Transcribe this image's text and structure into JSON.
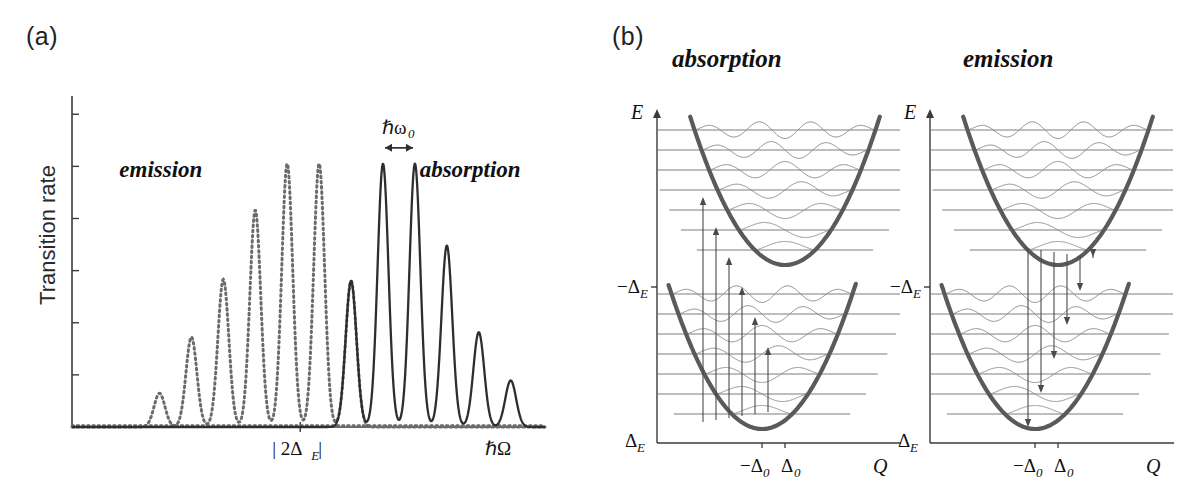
{
  "figure": {
    "panel_a_label": "(a)",
    "panel_b_label": "(b)"
  },
  "panel_a": {
    "y_axis_label": "Transition rate",
    "x_axis_label": "ℏΩ",
    "x_tick_label_main": "| 2Δ",
    "x_tick_label_sub": "E",
    "x_tick_label_end": " |",
    "annotation_spacing": "ℏω",
    "annotation_spacing_sub": "0",
    "region_left_label": "emission",
    "region_right_label": "absorption",
    "n_yticks": 6
  },
  "panel_b": {
    "left": {
      "title": "absorption",
      "y_axis_label": "E",
      "x_axis_label": "Q",
      "y_tick_upper": "−Δ",
      "y_tick_upper_sub": "E",
      "y_tick_lower": "Δ",
      "y_tick_lower_sub": "E",
      "x_tick_left": "−Δ",
      "x_tick_left_sub": "0",
      "x_tick_right": "Δ",
      "x_tick_right_sub": "0",
      "arrow_direction": "up",
      "n_transition_arrows": 6,
      "n_levels_per_well": 9
    },
    "right": {
      "title": "emission",
      "y_axis_label": "E",
      "x_axis_label": "Q",
      "y_tick_upper": "−Δ",
      "y_tick_upper_sub": "E",
      "y_tick_lower": "Δ",
      "y_tick_lower_sub": "E",
      "x_tick_left": "−Δ",
      "x_tick_left_sub": "0",
      "x_tick_right": "Δ",
      "x_tick_right_sub": "0",
      "arrow_direction": "down",
      "n_transition_arrows": 6,
      "n_levels_per_well": 9
    }
  },
  "colors": {
    "curve_solid": "#2e2e2e",
    "curve_dotted": "#6b6b6b",
    "axis": "#3a3a3a",
    "parabola": "#5a5a5a",
    "wavefunction": "#8a8a8a",
    "level_line": "#7d7d7d",
    "arrow": "#4a4a4a",
    "text": "#111111",
    "background": "#ffffff"
  },
  "chart_data": {
    "type": "line",
    "xlabel": "ℏΩ",
    "ylabel": "Transition rate",
    "xlim": [
      0,
      1
    ],
    "ylim": [
      0,
      1
    ],
    "grid": false,
    "legend": null,
    "annotations": [
      {
        "text": "emission",
        "x": 0.18,
        "y": 0.77
      },
      {
        "text": "absorption",
        "x": 0.8,
        "y": 0.77
      },
      {
        "text": "ℏω₀",
        "x": 0.585,
        "y": 0.9,
        "note": "double-headed arrow marks one-phonon peak spacing"
      },
      {
        "text": "| 2ΔE |",
        "x": 0.47,
        "y": -0.08,
        "note": "x-axis tick marking the zero-phonon gap"
      }
    ],
    "series": [
      {
        "name": "emission",
        "style": "dotted",
        "color": "#6b6b6b",
        "peak_spacing": 0.0675,
        "peak_width_sigma": 0.0115,
        "peaks_x": [
          0.185,
          0.2525,
          0.32,
          0.3875,
          0.455,
          0.5225
        ],
        "peaks_y": [
          0.105,
          0.28,
          0.46,
          0.675,
          0.82,
          0.82
        ]
      },
      {
        "name": "emission_tail",
        "style": "dotted",
        "color": "#6b6b6b",
        "peak_spacing": 0.0675,
        "peaks_x": [
          0.59
        ],
        "peaks_y": [
          0.455
        ]
      },
      {
        "name": "absorption",
        "style": "solid",
        "color": "#2e2e2e",
        "peak_spacing": 0.0675,
        "peak_width_sigma": 0.0115,
        "peaks_x": [
          0.59,
          0.6575,
          0.725,
          0.7925,
          0.86,
          0.9275
        ],
        "peaks_y": [
          0.455,
          0.82,
          0.82,
          0.565,
          0.295,
          0.145
        ]
      }
    ]
  },
  "diagram_data": {
    "type": "configuration-coordinate-diagram",
    "wells": [
      {
        "name": "excited-state-well",
        "center_q": 0.4,
        "min_energy_label": "−ΔE",
        "levels": 9
      },
      {
        "name": "ground-state-well",
        "center_q": 0.32,
        "min_energy_label": "ΔE",
        "levels": 9
      }
    ],
    "transitions_absorption": "vertical upward arrows from lower well to upper well",
    "transitions_emission": "vertical downward arrows from upper well to lower well"
  }
}
